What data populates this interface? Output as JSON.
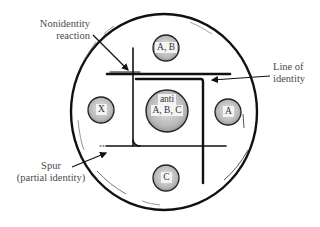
{
  "diagram": {
    "type": "double immunodiffusion (Ouchterlony) plate",
    "colors": {
      "stroke": "#111111",
      "well_fill": "#bdbdbd",
      "label_text": "#4a4a4a",
      "background": "#ffffff"
    },
    "wells": {
      "center": {
        "line1": "anti",
        "line2": "A, B, C"
      },
      "top": {
        "label": "A, B"
      },
      "left": {
        "label": "X"
      },
      "right": {
        "label": "A"
      },
      "bottom": {
        "label": "C"
      }
    },
    "annotations": {
      "nonidentity": {
        "line1": "Nonidentity",
        "line2": "reaction"
      },
      "identity": {
        "line1": "Line of",
        "line2": "identity"
      },
      "spur": {
        "line1": "Spur",
        "line2": "(partial identity)"
      }
    }
  }
}
